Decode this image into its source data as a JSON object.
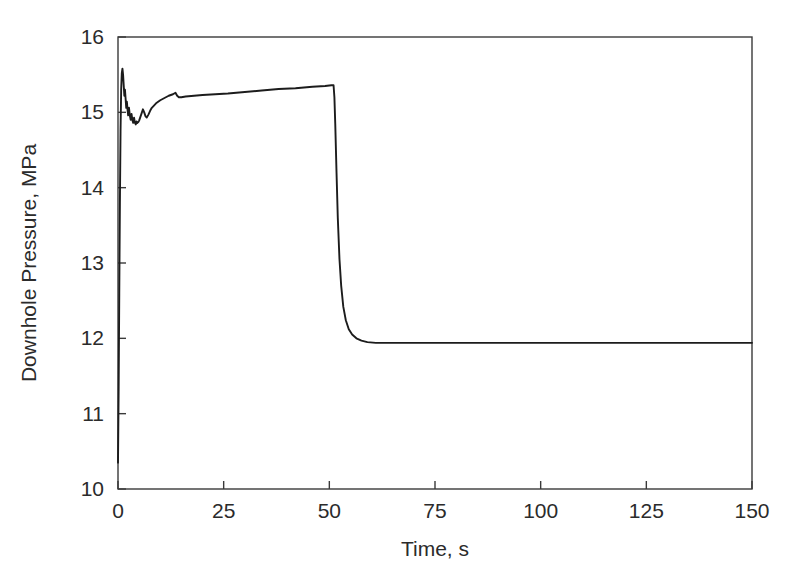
{
  "figure": {
    "background_color": "#ffffff",
    "line_color": "#1c1c1c",
    "axis_color": "#3a3a3a",
    "text_color": "#2b2b2b"
  },
  "chart_data": {
    "type": "line",
    "title": "",
    "xlabel": "Time, s",
    "ylabel": "Downhole Pressure, MPa",
    "xlim": [
      0,
      150
    ],
    "ylim": [
      10,
      16
    ],
    "xticks": [
      0,
      25,
      50,
      75,
      100,
      125,
      150
    ],
    "yticks": [
      10,
      11,
      12,
      13,
      14,
      15,
      16
    ],
    "xtick_labels": [
      "0",
      "25",
      "50",
      "75",
      "100",
      "125",
      "150"
    ],
    "ytick_labels": [
      "10",
      "11",
      "12",
      "13",
      "14",
      "15",
      "16"
    ],
    "grid": false,
    "legend": null,
    "annotations": [],
    "series": [
      {
        "name": "Downhole Pressure",
        "color": "#1c1c1c",
        "x": [
          0.0,
          0.15,
          0.3,
          0.45,
          0.6,
          0.75,
          0.9,
          1.05,
          1.2,
          1.35,
          1.5,
          1.65,
          1.8,
          1.95,
          2.1,
          2.25,
          2.4,
          2.6,
          2.8,
          3.0,
          3.2,
          3.4,
          3.6,
          3.8,
          4.0,
          4.2,
          4.4,
          4.6,
          4.8,
          5.0,
          5.3,
          5.6,
          5.9,
          6.2,
          6.5,
          6.8,
          7.2,
          7.6,
          8.0,
          8.5,
          9.0,
          9.5,
          10.0,
          11.0,
          12.0,
          13.0,
          13.6,
          14.0,
          14.4,
          15.0,
          16.0,
          18.0,
          20.0,
          23.0,
          26.0,
          30.0,
          34.0,
          38.0,
          42.0,
          46.0,
          49.0,
          50.5,
          51.0,
          51.2,
          51.4,
          51.7,
          52.0,
          52.4,
          52.8,
          53.3,
          53.9,
          54.6,
          55.4,
          56.4,
          57.6,
          59.0,
          61.0,
          64.0,
          68.0,
          74.0,
          82.0,
          92.0,
          105.0,
          120.0,
          135.0,
          150.0
        ],
        "y": [
          10.35,
          11.3,
          12.6,
          13.8,
          14.75,
          15.3,
          15.52,
          15.58,
          15.5,
          15.36,
          15.22,
          15.3,
          15.18,
          15.06,
          15.14,
          15.04,
          14.96,
          15.06,
          14.96,
          14.9,
          14.98,
          14.9,
          14.86,
          14.93,
          14.86,
          14.84,
          14.88,
          14.86,
          14.87,
          14.89,
          14.94,
          14.99,
          15.04,
          15.0,
          14.95,
          14.93,
          14.97,
          15.02,
          15.06,
          15.09,
          15.12,
          15.14,
          15.16,
          15.19,
          15.22,
          15.24,
          15.26,
          15.22,
          15.2,
          15.2,
          15.21,
          15.22,
          15.23,
          15.24,
          15.25,
          15.27,
          15.29,
          15.31,
          15.32,
          15.34,
          15.35,
          15.36,
          15.36,
          15.2,
          14.85,
          14.2,
          13.6,
          13.05,
          12.7,
          12.42,
          12.24,
          12.12,
          12.05,
          12.0,
          11.97,
          11.95,
          11.94,
          11.94,
          11.94,
          11.94,
          11.94,
          11.94,
          11.94,
          11.94,
          11.94,
          11.94
        ]
      }
    ]
  }
}
